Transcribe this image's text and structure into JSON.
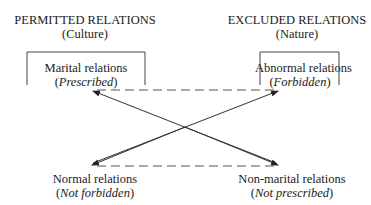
{
  "diagram": {
    "left_header": {
      "title": "PERMITTED RELATIONS",
      "subtitle": "(Culture)"
    },
    "right_header": {
      "title": "EXCLUDED RELATIONS",
      "subtitle": "(Nature)"
    },
    "nodes": {
      "top_left": {
        "label": "Marital relations",
        "sub_open": "(",
        "sub_italic": "Prescribed",
        "sub_close": ")"
      },
      "top_right": {
        "label": "Abnormal relations",
        "sub_open": "(",
        "sub_italic": "Forbidden",
        "sub_close": ")"
      },
      "bottom_left": {
        "label": "Normal relations",
        "sub_open": "(",
        "sub_italic": "Not forbidden",
        "sub_close": ")"
      },
      "bottom_right": {
        "label": "Non-marital relations",
        "sub_open": "(",
        "sub_italic": "Not prescribed",
        "sub_close": ")"
      }
    },
    "edges": [
      {
        "from": "bottom_right",
        "to": "top_left",
        "style": "solid",
        "arrow": "to"
      },
      {
        "from": "bottom_left",
        "to": "top_right",
        "style": "solid",
        "arrow": "to"
      },
      {
        "from": "top_right",
        "to": "top_left",
        "style": "dashed"
      },
      {
        "from": "bottom_left",
        "to": "bottom_right",
        "style": "dashed"
      }
    ],
    "line_color": "#333333",
    "dash_color": "#555555"
  }
}
